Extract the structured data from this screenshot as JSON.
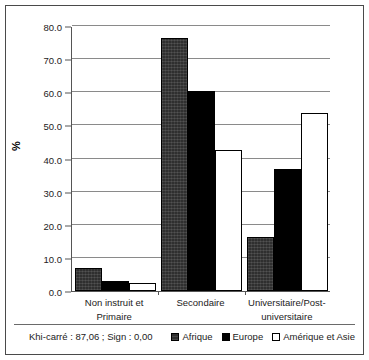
{
  "chart_data": {
    "type": "bar",
    "title": "",
    "xlabel": "",
    "ylabel": "%",
    "ylim": [
      0,
      80
    ],
    "ytick_step": 10,
    "ytick_labels": [
      "0.0",
      "10.0",
      "20.0",
      "30.0",
      "40.0",
      "50.0",
      "60.0",
      "70.0",
      "80.0"
    ],
    "ytick_values": [
      0,
      10,
      20,
      30,
      40,
      50,
      60,
      70,
      80
    ],
    "grid": true,
    "legend_position": "bottom-right",
    "categories": [
      "Non instruit et Primaire",
      "Secondaire",
      "Universitaire/Post-universitaire"
    ],
    "category_lines": [
      [
        "Non instruit et",
        "Primaire"
      ],
      [
        "Secondaire",
        ""
      ],
      [
        "Universitaire/Post-",
        "universitaire"
      ]
    ],
    "series": [
      {
        "name": "Afrique",
        "values": [
          6.9,
          76.5,
          16.2
        ],
        "color": "#2f2f2f"
      },
      {
        "name": "Europe",
        "values": [
          3.1,
          60.3,
          36.7
        ],
        "color": "#000000"
      },
      {
        "name": "Amérique et Asie",
        "values": [
          2.5,
          42.6,
          53.8
        ],
        "color": "#ffffff"
      }
    ],
    "annotation": "Khi-carré : 87,06 ; Sign : 0,00"
  },
  "legend": {
    "items": [
      {
        "label": "Afrique"
      },
      {
        "label": "Europe"
      },
      {
        "label": "Amérique et Asie"
      }
    ]
  },
  "footer": {
    "stat_note": "Khi-carré : 87,06 ; Sign : 0,00"
  }
}
